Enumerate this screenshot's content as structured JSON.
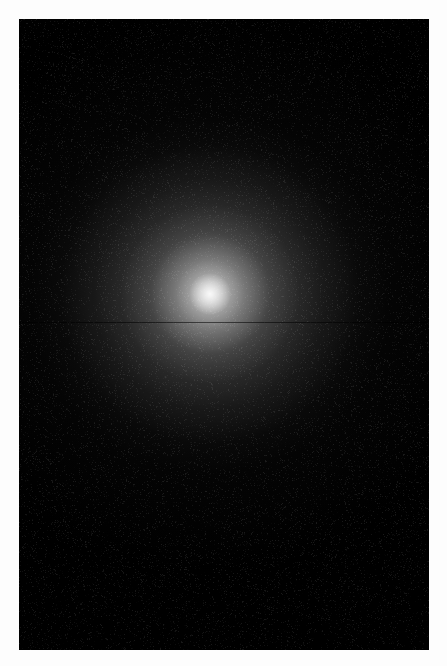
{
  "page": {
    "width": 447,
    "height": 666,
    "background_color": "#fdfdfd",
    "caption": ""
  },
  "plate": {
    "name": "globular-cluster-field",
    "x": 19,
    "y": 19,
    "width": 410,
    "height": 631,
    "sky_color": "#000000",
    "rendering": "grayscale",
    "seam_y": 303,
    "seam_color": "#000000",
    "description": "Dense globular star cluster, resolved into thousands of point sources, concentrated core fading radially into the sky background"
  },
  "chart_data": {
    "type": "scatter",
    "title": "",
    "subtitle": "",
    "xlabel": "",
    "ylabel": "",
    "grid": false,
    "legend": null,
    "xlim": [
      0,
      410
    ],
    "ylim": [
      0,
      631
    ],
    "colormap": "grayscale",
    "cluster": {
      "center_x": 191,
      "center_y": 275,
      "core_radius": 26,
      "half_light_radius": 96,
      "tidal_radius": 290,
      "total_point_sources": 5200,
      "core_peak_brightness": 1.0
    },
    "field_stars": {
      "count": 900,
      "distribution": "uniform"
    },
    "bright_stars": [
      {
        "x": 111,
        "y": 66,
        "radius": 5.2,
        "brightness": 0.95,
        "halo": true
      },
      {
        "x": 86,
        "y": 589,
        "radius": 4.6,
        "brightness": 0.92,
        "halo": true
      },
      {
        "x": 60,
        "y": 601,
        "radius": 3.4,
        "brightness": 0.8,
        "halo": true
      },
      {
        "x": 352,
        "y": 440,
        "radius": 4.4,
        "brightness": 0.9,
        "halo": true
      },
      {
        "x": 305,
        "y": 521,
        "radius": 4.0,
        "brightness": 0.88,
        "halo": true
      },
      {
        "x": 77,
        "y": 546,
        "radius": 3.9,
        "brightness": 0.86,
        "halo": true
      },
      {
        "x": 330,
        "y": 200,
        "radius": 3.6,
        "brightness": 0.84,
        "halo": true
      },
      {
        "x": 371,
        "y": 97,
        "radius": 3.5,
        "brightness": 0.83,
        "halo": true
      },
      {
        "x": 197,
        "y": 47,
        "radius": 3.2,
        "brightness": 0.82,
        "halo": true
      },
      {
        "x": 160,
        "y": 487,
        "radius": 3.4,
        "brightness": 0.82,
        "halo": true
      },
      {
        "x": 252,
        "y": 335,
        "radius": 3.3,
        "brightness": 0.81,
        "halo": true
      },
      {
        "x": 45,
        "y": 213,
        "radius": 3.1,
        "brightness": 0.79,
        "halo": true
      },
      {
        "x": 389,
        "y": 313,
        "radius": 3.0,
        "brightness": 0.78,
        "halo": true
      },
      {
        "x": 226,
        "y": 613,
        "radius": 3.4,
        "brightness": 0.8,
        "halo": true
      },
      {
        "x": 128,
        "y": 624,
        "radius": 3.0,
        "brightness": 0.77,
        "halo": true
      },
      {
        "x": 296,
        "y": 262,
        "radius": 3.0,
        "brightness": 0.8,
        "halo": true
      },
      {
        "x": 20,
        "y": 470,
        "radius": 2.9,
        "brightness": 0.76,
        "halo": true
      },
      {
        "x": 398,
        "y": 556,
        "radius": 3.1,
        "brightness": 0.78,
        "halo": true
      },
      {
        "x": 262,
        "y": 432,
        "radius": 2.9,
        "brightness": 0.76,
        "halo": true
      },
      {
        "x": 100,
        "y": 370,
        "radius": 2.8,
        "brightness": 0.75,
        "halo": true
      },
      {
        "x": 344,
        "y": 620,
        "radius": 3.2,
        "brightness": 0.79,
        "halo": true
      },
      {
        "x": 43,
        "y": 310,
        "radius": 2.8,
        "brightness": 0.74,
        "halo": true
      },
      {
        "x": 184,
        "y": 196,
        "radius": 2.7,
        "brightness": 0.8,
        "halo": true
      },
      {
        "x": 232,
        "y": 141,
        "radius": 2.7,
        "brightness": 0.78,
        "halo": true
      },
      {
        "x": 300,
        "y": 86,
        "radius": 2.7,
        "brightness": 0.76,
        "halo": true
      }
    ]
  },
  "accessibility": {
    "alt_text": "Black and white astronomical image of a globular star cluster with a dense bright core"
  }
}
